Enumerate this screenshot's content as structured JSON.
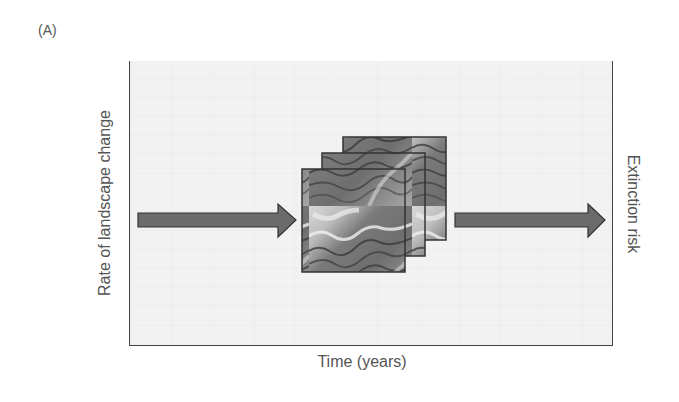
{
  "figure": {
    "panel_label": "(A)",
    "y_axis_label": "Rate of landscape change",
    "x_axis_label": "Time (years)",
    "right_label": "Extinction risk",
    "arrows": [
      {
        "name": "input-arrow",
        "direction": "right",
        "color": "#6b6b6b"
      },
      {
        "name": "output-arrow",
        "direction": "right",
        "color": "#6b6b6b"
      }
    ],
    "image_stack": {
      "description": "Stack of three overlapping grayscale landscape images",
      "count": 3
    },
    "colors": {
      "box_fill": "#f2f2f2",
      "box_border": "#444444",
      "arrow_fill": "#6b6b6b",
      "arrow_stroke": "#333333",
      "text": "#555555"
    }
  }
}
